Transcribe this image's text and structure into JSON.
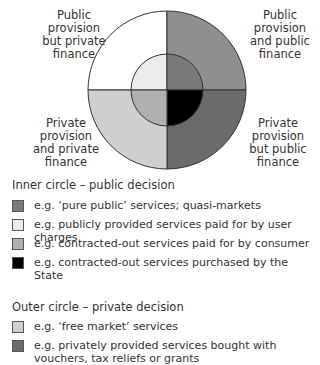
{
  "quadrant_labels": {
    "top_left": [
      "Public",
      "provision",
      "but private",
      "finance"
    ],
    "top_right": [
      "Public",
      "provision",
      "and public",
      "finance"
    ],
    "bottom_left": [
      "Private",
      "provision",
      "and private",
      "finance"
    ],
    "bottom_right": [
      "Private",
      "provision",
      "but public",
      "finance"
    ]
  },
  "colors": {
    "outer_top_left": "#ffffff",
    "outer_top_right": "#8f8f8f",
    "outer_bottom_left": "#cfcfcf",
    "outer_bottom_right": "#6b6b6b",
    "inner_top_left": "#ececec",
    "inner_top_right": "#7a7a7a",
    "inner_bottom_left": "#b0b0b0",
    "inner_bottom_right": "#000000"
  },
  "inner_legend": {
    "title": "Inner circle – public decision",
    "items": [
      {
        "color": "#7a7a7a",
        "text": "e.g. ‘pure public’ services; quasi-markets"
      },
      {
        "color": "#ececec",
        "text": "e.g. publicly provided services paid for by user charges"
      },
      {
        "color": "#b0b0b0",
        "text": "e.g. contracted-out services paid for by consumer"
      },
      {
        "color": "#000000",
        "text": "e.g. contracted-out services purchased by the State"
      }
    ]
  },
  "outer_legend": {
    "title": "Outer circle – private decision",
    "items": [
      {
        "color": "#cfcfcf",
        "text": "e.g. ‘free market’ services"
      },
      {
        "color": "#6b6b6b",
        "text": "e.g. privately provided services bought with vouchers, tax reliefs or grants"
      }
    ]
  }
}
